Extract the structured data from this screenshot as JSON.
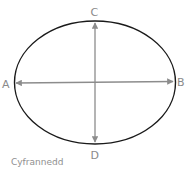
{
  "diagram": {
    "shape": "ellipse",
    "labels": {
      "left": "A",
      "right": "B",
      "top": "C",
      "bottom": "D"
    },
    "axes": [
      {
        "name": "horizontal",
        "from": "A",
        "to": "B",
        "arrows": "both"
      },
      {
        "name": "vertical",
        "from": "C",
        "to": "D",
        "arrows": "both"
      }
    ],
    "colors": {
      "ellipse_stroke": "#1a1a1a",
      "arrow": "#8c8c8c",
      "label": "#8a8a8a"
    }
  },
  "credit": "Cyfrannedd"
}
